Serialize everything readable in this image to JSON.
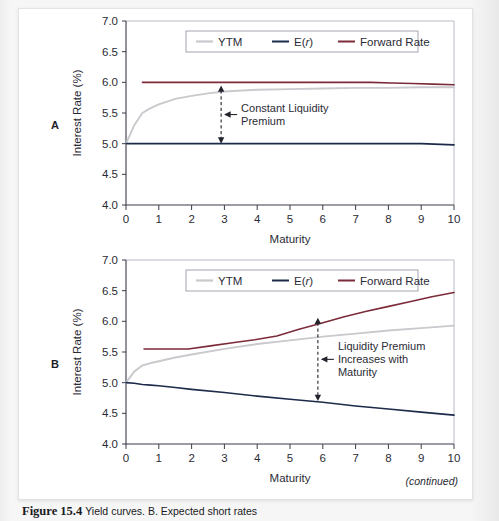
{
  "figure": {
    "continued_note": "(continued)",
    "caption_number": "Figure 15.4",
    "caption_text": "Yield curves. B. Expected short rates"
  },
  "colors": {
    "ytm": "#c9c9ce",
    "expected_rate": "#1c2b4a",
    "forward_rate": "#7c2b38",
    "axis": "#3a3a4a",
    "frame": "#b9b9c4",
    "text": "#2b2b36"
  },
  "panels": [
    {
      "letter": "A",
      "xlabel": "Maturity",
      "ylabel": "Interest Rate (%)",
      "xticks": [
        "0",
        "1",
        "2",
        "3",
        "4",
        "5",
        "6",
        "7",
        "8",
        "9",
        "10"
      ],
      "yticks": [
        "4.0",
        "4.5",
        "5.0",
        "5.5",
        "6.0",
        "6.5",
        "7.0"
      ],
      "legend": [
        {
          "label": "YTM",
          "color": "#c9c9ce"
        },
        {
          "label": "E(r)",
          "color": "#1c2b4a",
          "italic_part": "r"
        },
        {
          "label": "Forward Rate",
          "color": "#7c2b38"
        }
      ],
      "annotation": {
        "line1": "Constant Liquidity",
        "line2": "Premium",
        "at_maturity": 2.9,
        "top_value": 5.95,
        "bottom_value": 5.0
      }
    },
    {
      "letter": "B",
      "xlabel": "Maturity",
      "ylabel": "Interest Rate (%)",
      "xticks": [
        "0",
        "1",
        "2",
        "3",
        "4",
        "5",
        "6",
        "7",
        "8",
        "9",
        "10"
      ],
      "yticks": [
        "4.0",
        "4.5",
        "5.0",
        "5.5",
        "6.0",
        "6.5",
        "7.0"
      ],
      "legend": [
        {
          "label": "YTM",
          "color": "#c9c9ce"
        },
        {
          "label": "E(r)",
          "color": "#1c2b4a",
          "italic_part": "r"
        },
        {
          "label": "Forward Rate",
          "color": "#7c2b38"
        }
      ],
      "annotation": {
        "line1": "Liquidity Premium",
        "line2": "Increases with",
        "line3": "Maturity",
        "at_maturity": 5.85,
        "top_value": 6.06,
        "bottom_value": 4.7
      }
    }
  ],
  "chart_data": [
    {
      "type": "line",
      "title": "A",
      "xlabel": "Maturity",
      "ylabel": "Interest Rate (%)",
      "xlim": [
        0,
        10
      ],
      "ylim": [
        4.0,
        7.0
      ],
      "grid": false,
      "legend_position": "top-center",
      "x": [
        0,
        0.25,
        0.5,
        0.75,
        1,
        1.5,
        2,
        2.5,
        3,
        4,
        5,
        6,
        7,
        8,
        9,
        10
      ],
      "series": [
        {
          "name": "YTM",
          "color": "#c9c9ce",
          "values": [
            5.0,
            5.3,
            5.5,
            5.58,
            5.64,
            5.73,
            5.78,
            5.82,
            5.85,
            5.88,
            5.89,
            5.9,
            5.91,
            5.91,
            5.92,
            5.92
          ]
        },
        {
          "name": "E(r)",
          "color": "#1c2b4a",
          "values": [
            5.0,
            5.0,
            5.0,
            5.0,
            5.0,
            5.0,
            5.0,
            5.0,
            5.0,
            5.0,
            5.0,
            5.0,
            5.0,
            5.0,
            5.0,
            4.98
          ]
        },
        {
          "name": "Forward Rate",
          "color": "#7c2b38",
          "x_start": 0.5,
          "values": [
            6.0,
            6.0,
            6.0,
            6.0,
            6.0,
            6.0,
            6.0,
            6.0,
            6.0,
            6.0,
            6.0,
            6.0,
            5.99,
            5.98,
            5.97,
            5.96
          ]
        }
      ],
      "annotations": [
        {
          "text": "Constant Liquidity Premium",
          "x": 2.9,
          "y_top": 5.95,
          "y_bottom": 5.0
        }
      ]
    },
    {
      "type": "line",
      "title": "B",
      "xlabel": "Maturity",
      "ylabel": "Interest Rate (%)",
      "xlim": [
        0,
        10
      ],
      "ylim": [
        4.0,
        7.0
      ],
      "grid": false,
      "legend_position": "top-center",
      "x": [
        0,
        0.25,
        0.5,
        0.75,
        1,
        1.5,
        2,
        3,
        4,
        5,
        6,
        7,
        8,
        9,
        10
      ],
      "series": [
        {
          "name": "YTM",
          "color": "#c9c9ce",
          "values": [
            5.0,
            5.18,
            5.28,
            5.32,
            5.35,
            5.41,
            5.46,
            5.55,
            5.63,
            5.69,
            5.75,
            5.8,
            5.85,
            5.89,
            5.93
          ]
        },
        {
          "name": "E(r)",
          "color": "#1c2b4a",
          "values": [
            5.0,
            4.99,
            4.97,
            4.96,
            4.95,
            4.92,
            4.89,
            4.84,
            4.78,
            4.73,
            4.68,
            4.62,
            4.57,
            4.52,
            4.47
          ]
        },
        {
          "name": "Forward Rate",
          "color": "#7c2b38",
          "x_start": 0.55,
          "values": [
            5.55,
            5.55,
            5.55,
            5.6,
            5.65,
            5.7,
            5.76,
            5.87,
            5.97,
            6.07,
            6.16,
            6.24,
            6.32,
            6.4,
            6.47
          ]
        }
      ],
      "annotations": [
        {
          "text": "Liquidity Premium Increases with Maturity",
          "x": 5.85,
          "y_top": 6.06,
          "y_bottom": 4.7
        }
      ]
    }
  ]
}
